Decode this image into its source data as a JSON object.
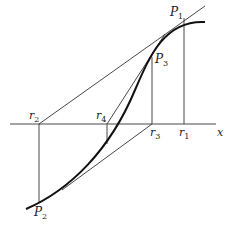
{
  "diagram": {
    "axis": {
      "label": "x"
    },
    "points": [
      {
        "id": "P1",
        "base": "P",
        "sub": "1"
      },
      {
        "id": "P2",
        "base": "P",
        "sub": "2"
      },
      {
        "id": "P3",
        "base": "P",
        "sub": "3"
      }
    ],
    "roots": [
      {
        "id": "r1",
        "base": "r",
        "sub": "1"
      },
      {
        "id": "r2",
        "base": "r",
        "sub": "2"
      },
      {
        "id": "r3",
        "base": "r",
        "sub": "3"
      },
      {
        "id": "r4",
        "base": "r",
        "sub": "4"
      }
    ],
    "colors": {
      "curve": "#111111",
      "line": "#333333",
      "background": "#ffffff"
    }
  }
}
